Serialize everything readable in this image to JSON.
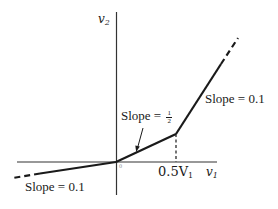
{
  "axes": {
    "x_label": "v",
    "x_label_sub": "1",
    "y_label": "v",
    "y_label_sub": "2",
    "tick_label": "0.5V",
    "tick_label_sub": "1",
    "origin_mark": "0"
  },
  "annotations": {
    "slope_upper": "Slope = 0.1",
    "slope_middle_prefix": "Slope = ",
    "slope_middle_num": "1",
    "slope_middle_den": "2",
    "slope_lower": "Slope = 0.1"
  },
  "colors": {
    "line": "#1a1a1a",
    "axis": "#333333",
    "background": "#ffffff"
  },
  "curve": {
    "description": "Piecewise-linear v2 vs v1 characteristic",
    "segments": [
      {
        "from": "-inf",
        "to": "0",
        "slope": 0.1,
        "style": "solid then dashed at far left"
      },
      {
        "from": "0",
        "to": "0.5V1",
        "slope": 0.5,
        "style": "solid"
      },
      {
        "from": "0.5V1",
        "to": "+inf",
        "slope": "steep",
        "style": "solid then dashed at far right"
      }
    ]
  }
}
